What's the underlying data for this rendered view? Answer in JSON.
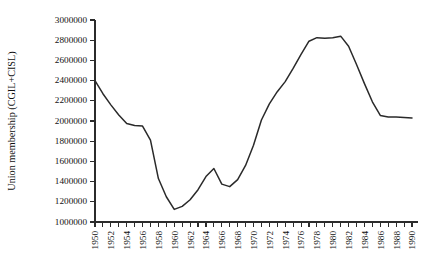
{
  "chart_data": {
    "type": "line",
    "title": "",
    "subtitle": "",
    "xlabel": "",
    "ylabel": "Union membership (CGIL+CISL)",
    "xlim": [
      1950,
      1990
    ],
    "ylim": [
      1000000,
      3000000
    ],
    "grid": false,
    "legend": "none",
    "y_tick_values": [
      1000000,
      1200000,
      1400000,
      1600000,
      1800000,
      2000000,
      2200000,
      2400000,
      2600000,
      2800000,
      3000000
    ],
    "y_tick_labels": [
      "1000000",
      "1200000",
      "1400000",
      "1600000",
      "1800000",
      "2000000",
      "2200000",
      "2400000",
      "2600000",
      "2800000",
      "3000000"
    ],
    "x_tick_values": [
      1950,
      1951,
      1952,
      1953,
      1954,
      1955,
      1956,
      1957,
      1958,
      1959,
      1960,
      1961,
      1962,
      1963,
      1964,
      1965,
      1966,
      1967,
      1968,
      1969,
      1970,
      1971,
      1972,
      1973,
      1974,
      1975,
      1976,
      1977,
      1978,
      1979,
      1980,
      1981,
      1982,
      1983,
      1984,
      1985,
      1986,
      1987,
      1988,
      1989,
      1990
    ],
    "x_tick_labels": [
      "1950",
      "1952",
      "1954",
      "1956",
      "1958",
      "1960",
      "1962",
      "1964",
      "1966",
      "1968",
      "1970",
      "1972",
      "1974",
      "1976",
      "1978",
      "1980",
      "1982",
      "1984",
      "1986",
      "1988",
      "1990"
    ],
    "x_label_values": [
      1950,
      1952,
      1954,
      1956,
      1958,
      1960,
      1962,
      1964,
      1966,
      1968,
      1970,
      1972,
      1974,
      1976,
      1978,
      1980,
      1982,
      1984,
      1986,
      1988,
      1990
    ],
    "x": [
      1950,
      1951,
      1952,
      1953,
      1954,
      1955,
      1956,
      1957,
      1958,
      1959,
      1960,
      1961,
      1962,
      1963,
      1964,
      1965,
      1966,
      1967,
      1968,
      1969,
      1970,
      1971,
      1972,
      1973,
      1974,
      1975,
      1976,
      1977,
      1978,
      1979,
      1980,
      1981,
      1982,
      1983,
      1984,
      1985,
      1986,
      1987,
      1988,
      1989,
      1990
    ],
    "values": [
      2400000,
      2270000,
      2160000,
      2060000,
      1975000,
      1955000,
      1950000,
      1810000,
      1430000,
      1250000,
      1125000,
      1155000,
      1220000,
      1320000,
      1450000,
      1530000,
      1375000,
      1350000,
      1420000,
      1560000,
      1760000,
      2010000,
      2170000,
      2290000,
      2390000,
      2520000,
      2660000,
      2790000,
      2825000,
      2820000,
      2825000,
      2840000,
      2740000,
      2560000,
      2370000,
      2190000,
      2055000,
      2040000,
      2040000,
      2035000,
      2030000
    ],
    "series_name": "Union membership (CGIL+CISL)",
    "line_color": "#2a2a2a",
    "background_color": "#ffffff"
  },
  "layout": {
    "plot_left": 95,
    "plot_right": 412,
    "plot_top": 20,
    "plot_bottom": 222
  }
}
